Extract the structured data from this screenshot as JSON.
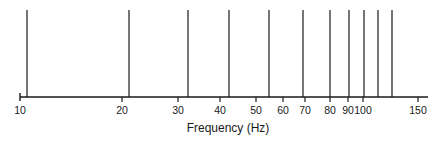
{
  "chart_data": {
    "type": "spectrum-lines",
    "title": "",
    "xlabel": "Frequency (Hz)",
    "ylabel": "",
    "xscale": "log",
    "xlim": [
      10,
      160
    ],
    "grid": false,
    "legend": null,
    "ticks": [
      {
        "value": 10,
        "label": "10",
        "px": 20
      },
      {
        "value": 20,
        "label": "20",
        "px": 122
      },
      {
        "value": 30,
        "label": "30",
        "px": 178
      },
      {
        "value": 40,
        "label": "40",
        "px": 220
      },
      {
        "value": 50,
        "label": "50",
        "px": 256
      },
      {
        "value": 60,
        "label": "60",
        "px": 283
      },
      {
        "value": 70,
        "label": "70",
        "px": 305
      },
      {
        "value": 80,
        "label": "80",
        "px": 330
      },
      {
        "value": 90,
        "label": "90",
        "px": 348
      },
      {
        "value": 100,
        "label": "100",
        "px": 363
      },
      {
        "value": 150,
        "label": "150",
        "px": 418
      }
    ],
    "lines": [
      {
        "frequency": 10.5,
        "px": 27
      },
      {
        "frequency": 21,
        "px": 129
      },
      {
        "frequency": 31.5,
        "px": 188
      },
      {
        "frequency": 42,
        "px": 229
      },
      {
        "frequency": 55,
        "px": 269
      },
      {
        "frequency": 69,
        "px": 303
      },
      {
        "frequency": 82,
        "px": 330
      },
      {
        "frequency": 94,
        "px": 349
      },
      {
        "frequency": 104,
        "px": 364
      },
      {
        "frequency": 114,
        "px": 378
      },
      {
        "frequency": 125,
        "px": 392
      }
    ]
  },
  "axis": {
    "x_start_px": 20,
    "x_end_px": 428,
    "y_px": 97,
    "line_top_px": 10,
    "color": "#1a1a1a"
  }
}
